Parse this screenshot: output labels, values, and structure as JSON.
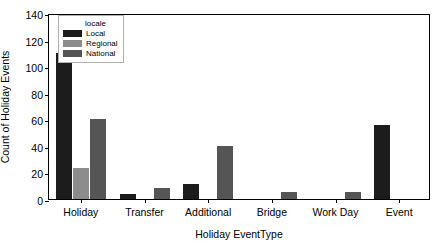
{
  "chart_data": {
    "type": "bar",
    "title": "",
    "xlabel": "Holiday EventType",
    "ylabel": "Count of Holiday Events",
    "categories": [
      "Holiday",
      "Transfer",
      "Additional",
      "Bridge",
      "Work Day",
      "Event"
    ],
    "series": [
      {
        "name": "Local",
        "color": "#1c1c1c",
        "values": [
          110,
          4,
          11,
          0,
          0,
          56
        ]
      },
      {
        "name": "Regional",
        "color": "#8c8c8c",
        "values": [
          23,
          0,
          0,
          0,
          0,
          0
        ]
      },
      {
        "name": "National",
        "color": "#555555",
        "values": [
          60,
          8,
          40,
          5,
          5,
          0
        ]
      }
    ],
    "ylim": [
      0,
      140
    ],
    "yticks": [
      0,
      20,
      40,
      60,
      80,
      100,
      120,
      140
    ],
    "ytick_labels": [
      "0",
      "20",
      "40",
      "60",
      "80",
      "100",
      "120",
      "140"
    ],
    "grid": false,
    "legend": {
      "title": "locale",
      "position": "upper-left",
      "entries": [
        {
          "label": "Local",
          "color": "#1c1c1c"
        },
        {
          "label": "Regional",
          "color": "#8c8c8c"
        },
        {
          "label": "National",
          "color": "#555555"
        }
      ]
    },
    "axis_color": "#000000",
    "background_color": "#ffffff"
  }
}
